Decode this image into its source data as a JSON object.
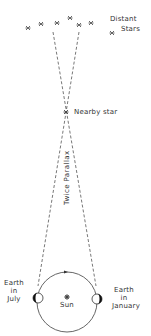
{
  "diagram": {
    "labels": {
      "distant_stars_line1": "Distant",
      "distant_stars_line2": "Stars",
      "nearby_star": "Nearby star",
      "twice_parallax": "Twice Parallax",
      "earth_july_line1": "Earth",
      "earth_july_line2": "in",
      "earth_july_line3": "July",
      "earth_january_line1": "Earth",
      "earth_january_line2": "in",
      "earth_january_line3": "January",
      "sun": "Sun"
    },
    "colors": {
      "line": "#555555",
      "text": "#333333",
      "earth_shadow": "#111111",
      "background": "#ffffff"
    }
  }
}
